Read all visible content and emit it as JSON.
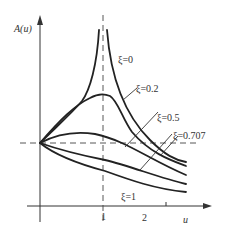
{
  "chart_data": {
    "type": "line",
    "title": "",
    "xlabel": "u",
    "ylabel": "A(u)",
    "x_ticks": [
      "1",
      "2"
    ],
    "xlim": [
      0,
      2.3
    ],
    "grid": false,
    "reference_lines": [
      {
        "orientation": "vertical",
        "at": 1,
        "style": "dashed"
      },
      {
        "orientation": "horizontal",
        "at": 1,
        "style": "dashed"
      }
    ],
    "series": [
      {
        "name": "ξ=0",
        "label": "ξ=0",
        "x": [
          0,
          0.3,
          0.5,
          0.7,
          0.85,
          0.95,
          1.05,
          1.15,
          1.3,
          1.5,
          1.8,
          2.3
        ],
        "values": [
          1,
          1.4,
          1.75,
          2.2,
          2.9,
          3.7,
          3.7,
          2.9,
          2.2,
          1.7,
          1.25,
          0.9
        ]
      },
      {
        "name": "ξ=0.2",
        "label": "ξ=0.2",
        "x": [
          0,
          0.3,
          0.5,
          0.7,
          0.85,
          1.0,
          1.15,
          1.3,
          1.5,
          1.8,
          2.3
        ],
        "values": [
          1,
          1.4,
          1.7,
          1.95,
          2.1,
          2.15,
          2.0,
          1.6,
          1.3,
          1.05,
          0.75
        ]
      },
      {
        "name": "ξ=0.5",
        "label": "ξ=0.5",
        "x": [
          0,
          0.3,
          0.6,
          0.9,
          1.2,
          1.5,
          1.8,
          2.3
        ],
        "values": [
          1,
          1.12,
          1.15,
          1.08,
          0.95,
          0.8,
          0.65,
          0.45
        ]
      },
      {
        "name": "ξ=0.707",
        "label": "ξ=0.707",
        "x": [
          0,
          0.4,
          0.8,
          1.2,
          1.6,
          2.0,
          2.3
        ],
        "values": [
          1,
          0.9,
          0.78,
          0.62,
          0.47,
          0.35,
          0.28
        ]
      },
      {
        "name": "ξ=1",
        "label": "ξ=1",
        "x": [
          0,
          0.4,
          0.8,
          1.2,
          1.6,
          2.0,
          2.3
        ],
        "values": [
          1,
          0.8,
          0.62,
          0.45,
          0.33,
          0.25,
          0.2
        ]
      }
    ],
    "pixel_paths": [
      "M40,143 C55,128 70,115 82,101 C90,90 97,65 99,30",
      "M107,30 C110,70 120,110 150,140 C165,155 175,160 186,162",
      "M40,143 C60,120 75,105 90,98 C97,94 103,93 110,96 C118,101 122,118 132,132 C150,153 170,160 186,166",
      "M40,143 C55,135 75,131 95,134 C125,140 150,160 186,175",
      "M40,143 C60,150 80,155 105,160 C130,166 160,178 186,184",
      "M40,143 C55,155 75,163 105,171 C130,180 155,189 186,192"
    ],
    "leader_lines": [
      "M123,100 L137,88",
      "M125,147 L158,112",
      "M140,170 L172,134",
      "M160,156 L178,136"
    ],
    "labels": {
      "y_axis": "A(u)",
      "x_axis": "u",
      "tick_1": "1",
      "tick_2": "2",
      "xi0": "ξ=0",
      "xi02": "ξ=0.2",
      "xi05": "ξ=0.5",
      "xi0707": "ξ=0.707",
      "xi1": "ξ=1"
    }
  }
}
